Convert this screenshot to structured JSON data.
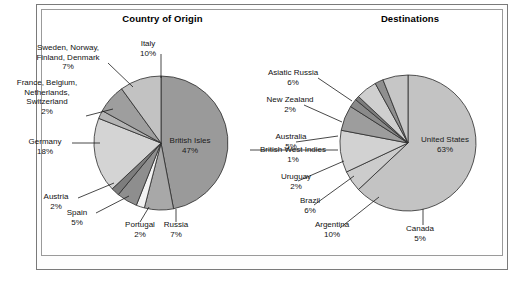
{
  "figure": {
    "background": "#ffffff",
    "frame_color": "#7a7a7a"
  },
  "charts": [
    {
      "id": "country-of-origin",
      "title": "Country of Origin",
      "slices": [
        {
          "label": "British Isles",
          "pct": "47%",
          "value": 47,
          "color": "#9a9a9a"
        },
        {
          "label": "Russia",
          "pct": "7%",
          "value": 7,
          "color": "#a8a8a8"
        },
        {
          "label": "Portugal",
          "pct": "2%",
          "value": 2,
          "color": "#f2f2f2"
        },
        {
          "label": "Spain",
          "pct": "5%",
          "value": 5,
          "color": "#8e8e8e"
        },
        {
          "label": "Austria",
          "pct": "2%",
          "value": 2,
          "color": "#7d7d7d"
        },
        {
          "label": "Germany",
          "pct": "18%",
          "value": 18,
          "color": "#d4d4d4"
        },
        {
          "label": "France, Belgium, Netherlands, Switzerland",
          "pct": "2%",
          "value": 2,
          "color": "#b4b4b4"
        },
        {
          "label": "Sweden, Norway, Finland, Denmark",
          "pct": "7%",
          "value": 7,
          "color": "#9e9e9e"
        },
        {
          "label": "Italy",
          "pct": "10%",
          "value": 10,
          "color": "#c2c2c2"
        }
      ]
    },
    {
      "id": "destinations",
      "title": "Destinations",
      "slices": [
        {
          "label": "United States",
          "pct": "63%",
          "value": 63,
          "color": "#c3c3c3"
        },
        {
          "label": "Canada",
          "pct": "5%",
          "value": 5,
          "color": "#cccccc"
        },
        {
          "label": "Argentina",
          "pct": "10%",
          "value": 10,
          "color": "#d2d2d2"
        },
        {
          "label": "Brazil",
          "pct": "6%",
          "value": 6,
          "color": "#9d9d9d"
        },
        {
          "label": "Uruguay",
          "pct": "2%",
          "value": 2,
          "color": "#8a8a8a"
        },
        {
          "label": "British West Indies",
          "pct": "1%",
          "value": 1,
          "color": "#7c7c7c"
        },
        {
          "label": "Australia",
          "pct": "5%",
          "value": 5,
          "color": "#cfcfcf"
        },
        {
          "label": "New Zealand",
          "pct": "2%",
          "value": 2,
          "color": "#8f8f8f"
        },
        {
          "label": "Asiatic Russia",
          "pct": "6%",
          "value": 6,
          "color": "#c6c6c6"
        }
      ]
    }
  ],
  "labels": {
    "origin": {
      "sweden_l1": "Sweden, Norway,",
      "sweden_l2": "Finland, Denmark",
      "sweden_pct": "7%",
      "italy": "Italy",
      "italy_pct": "10%",
      "france_l1": "France, Belgium,",
      "france_l2": "Netherlands,",
      "france_l3": "Switzerland",
      "france_pct": "2%",
      "germany": "Germany",
      "germany_pct": "18%",
      "austria": "Austria",
      "austria_pct": "2%",
      "spain": "Spain",
      "spain_pct": "5%",
      "portugal": "Portugal",
      "portugal_pct": "2%",
      "russia": "Russia",
      "russia_pct": "7%",
      "british_isles": "British Isles",
      "british_isles_pct": "47%"
    },
    "destinations": {
      "asiatic_russia": "Asiatic Russia",
      "asiatic_russia_pct": "6%",
      "new_zealand": "New Zealand",
      "new_zealand_pct": "2%",
      "australia": "Australia",
      "australia_pct": "5%",
      "bwi": "British West Indies",
      "bwi_pct": "1%",
      "uruguay": "Uruguay",
      "uruguay_pct": "2%",
      "brazil": "Brazil",
      "brazil_pct": "6%",
      "argentina": "Argentina",
      "argentina_pct": "10%",
      "canada": "Canada",
      "canada_pct": "5%",
      "united_states": "United States",
      "united_states_pct": "63%"
    }
  },
  "chart_data": [
    {
      "type": "pie",
      "title": "Country of Origin",
      "categories": [
        "British Isles",
        "Russia",
        "Portugal",
        "Spain",
        "Austria",
        "Germany",
        "France, Belgium, Netherlands, Switzerland",
        "Sweden, Norway, Finland, Denmark",
        "Italy"
      ],
      "values": [
        47,
        7,
        2,
        5,
        2,
        18,
        2,
        7,
        10
      ],
      "unit": "percent",
      "start_angle_deg": 0,
      "direction": "clockwise",
      "labels_outside": true,
      "legend": "none",
      "grid": false
    },
    {
      "type": "pie",
      "title": "Destinations",
      "categories": [
        "United States",
        "Canada",
        "Argentina",
        "Brazil",
        "Uruguay",
        "British West Indies",
        "Australia",
        "New Zealand",
        "Asiatic Russia"
      ],
      "values": [
        63,
        5,
        10,
        6,
        2,
        1,
        5,
        2,
        6
      ],
      "unit": "percent",
      "start_angle_deg": 0,
      "direction": "clockwise",
      "labels_outside": true,
      "legend": "none",
      "grid": false
    }
  ]
}
